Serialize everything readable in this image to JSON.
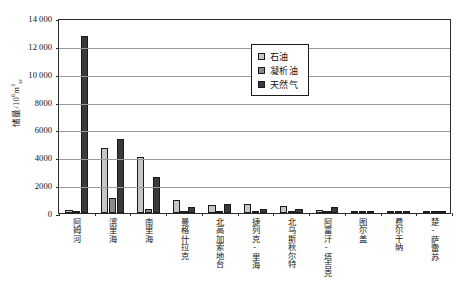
{
  "chart_data": {
    "type": "bar",
    "title": "",
    "xlabel": "",
    "ylabel": "储量/10⁶m³ₛc",
    "ylabel_parts": {
      "prefix": "储量/10",
      "sup": "6",
      "base": "m",
      "exp": "3",
      "sub": "sc"
    },
    "ylim": [
      0,
      14000
    ],
    "yticks": [
      0,
      2000,
      4000,
      6000,
      8000,
      10000,
      12000,
      14000
    ],
    "ytick_labels": [
      "0",
      "2000",
      "4000",
      "6000",
      "8000",
      "10 000",
      "12 000",
      "14 000"
    ],
    "grid": true,
    "legend_position": "upper-center-right",
    "categories": [
      "阿姆河",
      "滨里海",
      "南里海",
      "曼格什拉克",
      "北高加索地台",
      "捷列克-里海",
      "北乌斯秋尔特",
      "阿富汗-塔吉克",
      "图尔盖",
      "费尔干纳",
      "楚-萨雷苏"
    ],
    "series": [
      {
        "name": "石油",
        "color": "#c6c6c6",
        "values": [
          210,
          4680,
          4010,
          930,
          610,
          660,
          500,
          210,
          160,
          60,
          25
        ]
      },
      {
        "name": "凝析油",
        "color": "#8a8a8a",
        "values": [
          70,
          160,
          120,
          40,
          60,
          40,
          30,
          25,
          20,
          15,
          10
        ]
      },
      {
        "name": "天然气",
        "color": "#3a3a3a",
        "values": [
          12720,
          5290,
          2570,
          440,
          670,
          300,
          280,
          420,
          130,
          140,
          40
        ]
      }
    ],
    "condensate_overlay_values": [
      0,
      1050,
      300,
      0,
      0,
      0,
      0,
      0,
      0,
      0,
      0
    ]
  },
  "legend": {
    "items": [
      {
        "label": "石油",
        "swatch": "#c6c6c6"
      },
      {
        "label": "凝析油",
        "swatch": "#8a8a8a"
      },
      {
        "label": "天然气",
        "swatch": "#3a3a3a"
      }
    ]
  }
}
